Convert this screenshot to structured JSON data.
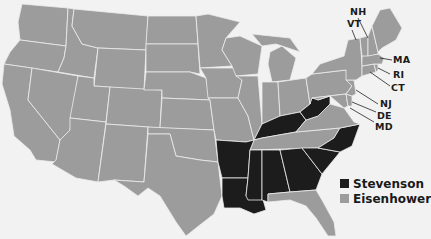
{
  "title": "",
  "colors": {
    "stevenson": "#1c1c1c",
    "eisenhower": "#9c9c9c",
    "background": "#f2f2f2"
  },
  "legend": [
    {
      "key": "stevenson",
      "label": "Stevenson",
      "color": "#1c1c1c"
    },
    {
      "key": "eisenhower",
      "label": "Eisenhower",
      "color": "#9c9c9c"
    }
  ],
  "callout_labels": [
    "NH",
    "VT",
    "MA",
    "RI",
    "CT",
    "NJ",
    "DE",
    "MD"
  ],
  "labels": {
    "NH": "NH",
    "VT": "VT",
    "MA": "MA",
    "RI": "RI",
    "CT": "CT",
    "NJ": "NJ",
    "DE": "DE",
    "MD": "MD"
  },
  "winners": {
    "stevenson": [
      "KY",
      "WV",
      "NC",
      "SC",
      "GA",
      "AL",
      "MS",
      "LA",
      "AR"
    ],
    "eisenhower": [
      "WA",
      "OR",
      "CA",
      "ID",
      "NV",
      "MT",
      "WY",
      "UT",
      "AZ",
      "CO",
      "NM",
      "ND",
      "SD",
      "NE",
      "KS",
      "OK",
      "TX",
      "MN",
      "IA",
      "MO",
      "WI",
      "IL",
      "MI",
      "IN",
      "OH",
      "TN",
      "FL",
      "VA",
      "MD",
      "DE",
      "PA",
      "NJ",
      "NY",
      "CT",
      "RI",
      "MA",
      "VT",
      "NH",
      "ME"
    ]
  }
}
